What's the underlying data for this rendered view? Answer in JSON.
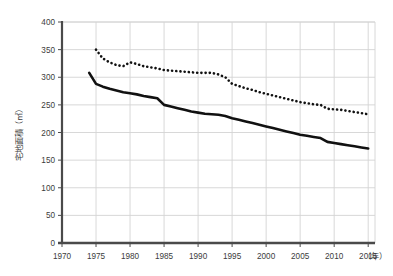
{
  "chart_data": {
    "type": "line",
    "title": "",
    "subtitle": "",
    "xlabel": "（年）",
    "ylabel": "宅地面積（㎡）",
    "xlim": [
      1970,
      2016
    ],
    "ylim": [
      0,
      400
    ],
    "grid": true,
    "legend_position": "none",
    "x_ticks": [
      "1970",
      "1975",
      "1980",
      "1985",
      "1990",
      "1995",
      "2000",
      "2005",
      "2010",
      "2015"
    ],
    "x_tick_values": [
      1970,
      1975,
      1980,
      1985,
      1990,
      1995,
      2000,
      2005,
      2010,
      2015
    ],
    "y_ticks": [
      "0",
      "50",
      "100",
      "150",
      "200",
      "250",
      "300",
      "350",
      "400"
    ],
    "y_tick_values": [
      0,
      50,
      100,
      150,
      200,
      250,
      300,
      350,
      400
    ],
    "series": [
      {
        "name": "solid-series",
        "style": "solid",
        "color": "#111111",
        "x": [
          1974,
          1975,
          1976,
          1977,
          1978,
          1979,
          1980,
          1981,
          1982,
          1983,
          1984,
          1985,
          1986,
          1987,
          1988,
          1989,
          1990,
          1991,
          1992,
          1993,
          1994,
          1995,
          1996,
          1997,
          1998,
          1999,
          2000,
          2001,
          2002,
          2003,
          2004,
          2005,
          2006,
          2007,
          2008,
          2009,
          2010,
          2011,
          2012,
          2013,
          2014,
          2015
        ],
        "values": [
          308,
          288,
          283,
          279,
          276,
          273,
          271,
          269,
          266,
          264,
          262,
          250,
          247,
          244,
          241,
          238,
          236,
          234,
          233,
          232,
          230,
          226,
          223,
          220,
          217,
          214,
          211,
          208,
          205,
          202,
          199,
          196,
          194,
          192,
          190,
          183,
          181,
          179,
          177,
          175,
          173,
          171
        ]
      },
      {
        "name": "dotted-series",
        "style": "dotted",
        "color": "#111111",
        "x": [
          1975,
          1976,
          1977,
          1978,
          1979,
          1980,
          1981,
          1982,
          1983,
          1984,
          1985,
          1986,
          1987,
          1988,
          1989,
          1990,
          1991,
          1992,
          1993,
          1994,
          1995,
          1996,
          1997,
          1998,
          1999,
          2000,
          2001,
          2002,
          2003,
          2004,
          2005,
          2006,
          2007,
          2008,
          2009,
          2010,
          2011,
          2012,
          2013,
          2014,
          2015
        ],
        "values": [
          350,
          334,
          327,
          322,
          320,
          327,
          324,
          320,
          318,
          316,
          313,
          312,
          311,
          310,
          309,
          308,
          308,
          308,
          305,
          300,
          288,
          284,
          280,
          277,
          273,
          270,
          267,
          264,
          261,
          258,
          255,
          253,
          251,
          250,
          243,
          242,
          241,
          239,
          237,
          235,
          233
        ]
      }
    ]
  },
  "layout": {
    "plot_left": 62,
    "plot_right": 375,
    "plot_top": 22,
    "plot_bottom": 243,
    "grid_color": "#d4d4d4",
    "axis_color": "#4a4a4a",
    "background": "#ffffff"
  }
}
